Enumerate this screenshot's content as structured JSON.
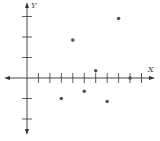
{
  "chart_data": {
    "type": "scatter",
    "title": "",
    "xlabel": "X",
    "ylabel": "Y",
    "xlim": [
      -2,
      11
    ],
    "ylim": [
      -3,
      3.6
    ],
    "x_ticks": [
      1,
      2,
      3,
      4,
      5,
      6,
      7,
      8,
      9,
      10
    ],
    "y_ticks": [
      -2,
      -1,
      1,
      2,
      3
    ],
    "grid": false,
    "legend": "none",
    "series": [
      {
        "name": "points",
        "color": "#555555",
        "points": [
          {
            "x": 3,
            "y": -1.0
          },
          {
            "x": 4,
            "y": 1.85
          },
          {
            "x": 5,
            "y": -0.65
          },
          {
            "x": 6,
            "y": 0.35
          },
          {
            "x": 7,
            "y": -1.15
          },
          {
            "x": 8,
            "y": 2.9
          },
          {
            "x": 9,
            "y": 0.0
          }
        ]
      }
    ],
    "axis_color": "#333333"
  }
}
